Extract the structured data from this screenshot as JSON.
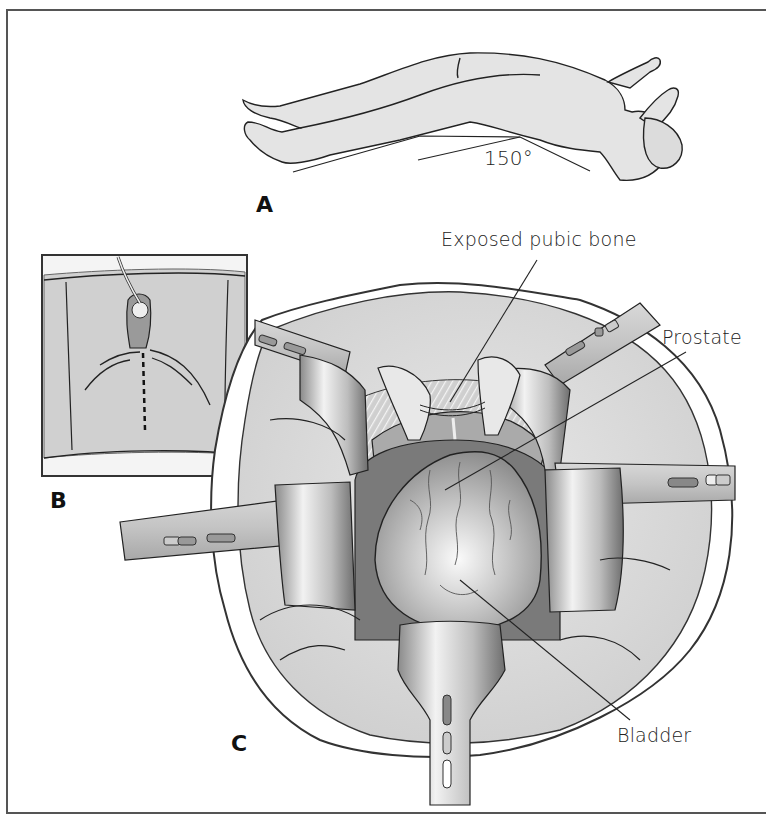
{
  "figure": {
    "panels": {
      "a": {
        "label": "A",
        "angle_label": "150°"
      },
      "b": {
        "label": "B"
      },
      "c": {
        "label": "C"
      }
    },
    "annotations": {
      "pubic_bone": "Exposed pubic  bone",
      "prostate": "Prostate",
      "bladder": "Bladder"
    },
    "colors": {
      "outline": "#222222",
      "skin": "#e2e2e2",
      "drape": "#d6d6d6",
      "retractor": "#c9c9c9",
      "tissue": "#b8b8b8"
    }
  }
}
